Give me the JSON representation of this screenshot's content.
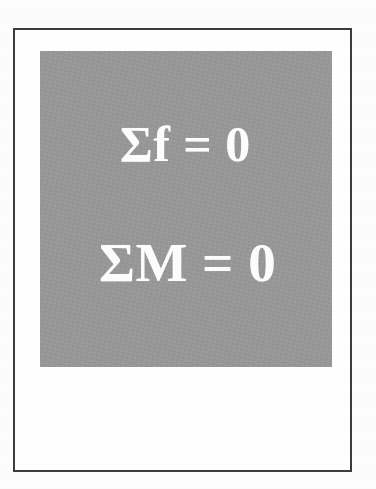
{
  "page": {
    "background_color": "#fdfdfd",
    "width_px": 376,
    "height_px": 489
  },
  "slide": {
    "frame": {
      "border_color": "#3c3c3e",
      "border_width_px": 2,
      "background_color": "#ffffff"
    },
    "panel": {
      "fill_color": "#989899",
      "text_color": "#fdfdfd"
    },
    "equations": [
      {
        "id": "sum-of-forces",
        "text": "Σf = 0",
        "symbol": "Σ",
        "variable": "f",
        "operator": "=",
        "value": "0"
      },
      {
        "id": "sum-of-moments",
        "text": "ΣM = 0",
        "symbol": "Σ",
        "variable": "M",
        "operator": "=",
        "value": "0"
      }
    ]
  }
}
